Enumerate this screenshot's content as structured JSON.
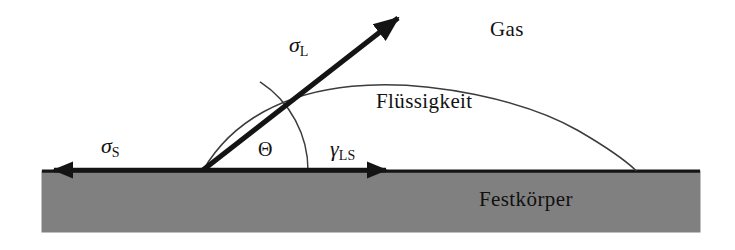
{
  "figure": {
    "background_color": "#ffffff",
    "line_color": "#141414",
    "solid_fill_color": "#808080"
  },
  "regions": {
    "gas_label": "Gas",
    "liquid_label": "Flüssigkeit",
    "solid_label": "Festkörper"
  },
  "vectors": {
    "sigma_l": {
      "symbol": "σ",
      "subscript": "L",
      "direction": "up-right",
      "description": "liquid surface tension vector"
    },
    "sigma_s": {
      "symbol": "σ",
      "subscript": "S",
      "direction": "left",
      "description": "solid surface tension vector"
    },
    "gamma_ls": {
      "symbol": "γ",
      "subscript": "LS",
      "direction": "right",
      "description": "liquid-solid interfacial tension vector"
    }
  },
  "angle": {
    "symbol": "Θ",
    "name": "contact-angle",
    "value_degrees": 57
  },
  "geometry": {
    "solid_block": {
      "x": 42,
      "y": 171,
      "width": 658,
      "height": 61
    },
    "contact_point": {
      "x": 203,
      "y": 170
    },
    "droplet_right_contact": {
      "x": 636,
      "y": 171
    },
    "droplet_apex": {
      "x": 420,
      "y": 84
    },
    "sigma_l_tip": {
      "x": 406,
      "y": 10
    },
    "sigma_s_tip": {
      "x": 46,
      "y": 170
    },
    "gamma_ls_tip": {
      "x": 396,
      "y": 170
    },
    "arc_radius": 105
  }
}
